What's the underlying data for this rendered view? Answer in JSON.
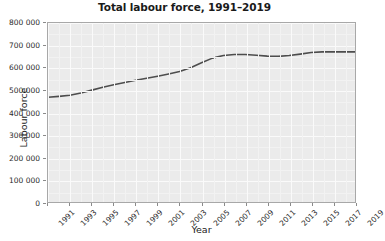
{
  "chart_data": {
    "type": "line",
    "title": "Total labour force, 1991–2019",
    "xlabel": "Year",
    "ylabel": "Labour force",
    "xlim": [
      1991,
      2019
    ],
    "ylim": [
      0,
      800000
    ],
    "grid": true,
    "legend": "none",
    "line_color": "#4d4d4d",
    "plot_background": "#ebebeb",
    "y_ticks": [
      0,
      100000,
      200000,
      300000,
      400000,
      500000,
      600000,
      700000,
      800000
    ],
    "y_tick_labels": [
      "0",
      "100 000",
      "200 000",
      "300 000",
      "400 000",
      "500 000",
      "600 000",
      "700 000",
      "800 000"
    ],
    "x_ticks": [
      1991,
      1993,
      1995,
      1997,
      1999,
      2001,
      2003,
      2005,
      2007,
      2009,
      2011,
      2013,
      2015,
      2017,
      2019
    ],
    "x_tick_labels": [
      "1991",
      "1993",
      "1995",
      "1997",
      "1999",
      "2001",
      "2003",
      "2005",
      "2007",
      "2009",
      "2011",
      "2013",
      "2015",
      "2017",
      "2019"
    ],
    "x": [
      1991,
      1992,
      1993,
      1994,
      1995,
      1996,
      1997,
      1998,
      1999,
      2000,
      2001,
      2002,
      2003,
      2004,
      2005,
      2006,
      2007,
      2008,
      2009,
      2010,
      2011,
      2012,
      2013,
      2014,
      2015,
      2016,
      2017,
      2018,
      2019
    ],
    "values": [
      468000,
      472000,
      477000,
      487000,
      500000,
      513000,
      524000,
      534000,
      544000,
      553000,
      562000,
      572000,
      583000,
      600000,
      622000,
      643000,
      655000,
      659000,
      659000,
      656000,
      652000,
      651000,
      655000,
      661000,
      668000,
      671000,
      671000,
      671000,
      671000
    ],
    "series_name": "Total labour force"
  }
}
